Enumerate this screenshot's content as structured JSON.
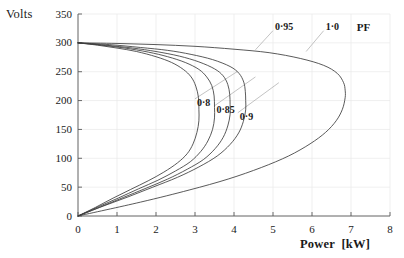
{
  "chart_data": {
    "type": "line",
    "title": "",
    "xlabel": "Power  [kW]",
    "ylabel": "Volts",
    "xlim": [
      0,
      8
    ],
    "ylim": [
      0,
      350
    ],
    "xticks": [
      "0",
      "1",
      "2",
      "3",
      "4",
      "5",
      "6",
      "7",
      "8"
    ],
    "yticks": [
      "0",
      "50",
      "100",
      "150",
      "200",
      "250",
      "300",
      "350"
    ],
    "grid": true,
    "legend_position": "inline-annotations",
    "legend_title": "PF",
    "series": [
      {
        "name": "0·8",
        "label": "0·8",
        "nose_point": {
          "x": 3.1,
          "y": 165
        },
        "upper_branch": [
          {
            "x": 0.0,
            "y": 300
          },
          {
            "x": 0.5,
            "y": 296
          },
          {
            "x": 1.0,
            "y": 291
          },
          {
            "x": 1.5,
            "y": 285
          },
          {
            "x": 2.0,
            "y": 276
          },
          {
            "x": 2.4,
            "y": 266
          },
          {
            "x": 2.7,
            "y": 254
          },
          {
            "x": 2.9,
            "y": 241
          },
          {
            "x": 3.02,
            "y": 225
          },
          {
            "x": 3.09,
            "y": 205
          },
          {
            "x": 3.1,
            "y": 185
          },
          {
            "x": 3.1,
            "y": 165
          }
        ],
        "lower_branch": [
          {
            "x": 3.1,
            "y": 165
          },
          {
            "x": 3.05,
            "y": 145
          },
          {
            "x": 2.95,
            "y": 125
          },
          {
            "x": 2.8,
            "y": 108
          },
          {
            "x": 2.55,
            "y": 92
          },
          {
            "x": 2.2,
            "y": 76
          },
          {
            "x": 1.8,
            "y": 61
          },
          {
            "x": 1.35,
            "y": 46
          },
          {
            "x": 0.9,
            "y": 31
          },
          {
            "x": 0.45,
            "y": 15
          },
          {
            "x": 0.0,
            "y": 0
          }
        ]
      },
      {
        "name": "0·85",
        "label": "0·85",
        "nose_point": {
          "x": 3.5,
          "y": 170
        },
        "upper_branch": [
          {
            "x": 0.0,
            "y": 300
          },
          {
            "x": 0.6,
            "y": 296
          },
          {
            "x": 1.2,
            "y": 291
          },
          {
            "x": 1.8,
            "y": 284
          },
          {
            "x": 2.3,
            "y": 276
          },
          {
            "x": 2.75,
            "y": 266
          },
          {
            "x": 3.1,
            "y": 254
          },
          {
            "x": 3.3,
            "y": 241
          },
          {
            "x": 3.43,
            "y": 226
          },
          {
            "x": 3.49,
            "y": 208
          },
          {
            "x": 3.5,
            "y": 188
          },
          {
            "x": 3.5,
            "y": 170
          }
        ],
        "lower_branch": [
          {
            "x": 3.5,
            "y": 170
          },
          {
            "x": 3.45,
            "y": 150
          },
          {
            "x": 3.33,
            "y": 130
          },
          {
            "x": 3.15,
            "y": 112
          },
          {
            "x": 2.88,
            "y": 94
          },
          {
            "x": 2.5,
            "y": 78
          },
          {
            "x": 2.05,
            "y": 62
          },
          {
            "x": 1.55,
            "y": 47
          },
          {
            "x": 1.03,
            "y": 31
          },
          {
            "x": 0.52,
            "y": 16
          },
          {
            "x": 0.0,
            "y": 0
          }
        ]
      },
      {
        "name": "0·9",
        "label": "0·9",
        "nose_point": {
          "x": 3.9,
          "y": 176
        },
        "upper_branch": [
          {
            "x": 0.0,
            "y": 300
          },
          {
            "x": 0.7,
            "y": 296
          },
          {
            "x": 1.4,
            "y": 291
          },
          {
            "x": 2.0,
            "y": 285
          },
          {
            "x": 2.6,
            "y": 277
          },
          {
            "x": 3.1,
            "y": 267
          },
          {
            "x": 3.5,
            "y": 255
          },
          {
            "x": 3.72,
            "y": 243
          },
          {
            "x": 3.84,
            "y": 228
          },
          {
            "x": 3.89,
            "y": 211
          },
          {
            "x": 3.9,
            "y": 193
          },
          {
            "x": 3.9,
            "y": 176
          }
        ],
        "lower_branch": [
          {
            "x": 3.9,
            "y": 176
          },
          {
            "x": 3.84,
            "y": 156
          },
          {
            "x": 3.72,
            "y": 136
          },
          {
            "x": 3.52,
            "y": 117
          },
          {
            "x": 3.22,
            "y": 98
          },
          {
            "x": 2.8,
            "y": 81
          },
          {
            "x": 2.3,
            "y": 64
          },
          {
            "x": 1.74,
            "y": 48
          },
          {
            "x": 1.16,
            "y": 32
          },
          {
            "x": 0.58,
            "y": 16
          },
          {
            "x": 0.0,
            "y": 0
          }
        ]
      },
      {
        "name": "0·95",
        "label": "0·95",
        "nose_point": {
          "x": 4.3,
          "y": 184
        },
        "upper_branch": [
          {
            "x": 0.0,
            "y": 300
          },
          {
            "x": 0.8,
            "y": 297
          },
          {
            "x": 1.6,
            "y": 292
          },
          {
            "x": 2.3,
            "y": 287
          },
          {
            "x": 2.9,
            "y": 280
          },
          {
            "x": 3.45,
            "y": 271
          },
          {
            "x": 3.9,
            "y": 259
          },
          {
            "x": 4.13,
            "y": 247
          },
          {
            "x": 4.25,
            "y": 232
          },
          {
            "x": 4.29,
            "y": 216
          },
          {
            "x": 4.3,
            "y": 200
          },
          {
            "x": 4.3,
            "y": 184
          }
        ],
        "lower_branch": [
          {
            "x": 4.3,
            "y": 184
          },
          {
            "x": 4.24,
            "y": 164
          },
          {
            "x": 4.12,
            "y": 144
          },
          {
            "x": 3.9,
            "y": 124
          },
          {
            "x": 3.57,
            "y": 104
          },
          {
            "x": 3.1,
            "y": 85
          },
          {
            "x": 2.55,
            "y": 67
          },
          {
            "x": 1.92,
            "y": 50
          },
          {
            "x": 1.28,
            "y": 33
          },
          {
            "x": 0.64,
            "y": 17
          },
          {
            "x": 0.0,
            "y": 0
          }
        ]
      },
      {
        "name": "1·0",
        "label": "1·0",
        "nose_point": {
          "x": 6.85,
          "y": 205
        },
        "upper_branch": [
          {
            "x": 0.0,
            "y": 300
          },
          {
            "x": 1.0,
            "y": 299
          },
          {
            "x": 2.0,
            "y": 297
          },
          {
            "x": 3.0,
            "y": 294
          },
          {
            "x": 4.0,
            "y": 289
          },
          {
            "x": 4.9,
            "y": 283
          },
          {
            "x": 5.7,
            "y": 273
          },
          {
            "x": 6.3,
            "y": 261
          },
          {
            "x": 6.65,
            "y": 247
          },
          {
            "x": 6.81,
            "y": 231
          },
          {
            "x": 6.85,
            "y": 218
          },
          {
            "x": 6.85,
            "y": 205
          }
        ],
        "lower_branch": [
          {
            "x": 6.85,
            "y": 205
          },
          {
            "x": 6.78,
            "y": 185
          },
          {
            "x": 6.62,
            "y": 165
          },
          {
            "x": 6.35,
            "y": 145
          },
          {
            "x": 5.95,
            "y": 125
          },
          {
            "x": 5.4,
            "y": 104
          },
          {
            "x": 4.7,
            "y": 84
          },
          {
            "x": 3.85,
            "y": 64
          },
          {
            "x": 2.85,
            "y": 45
          },
          {
            "x": 1.6,
            "y": 24
          },
          {
            "x": 0.0,
            "y": 0
          }
        ]
      }
    ],
    "annotations": [
      {
        "label": "0·8",
        "text_x": 3.05,
        "text_y": 196,
        "leader_to_x": 4.1,
        "leader_to_y": 251
      },
      {
        "label": "0·85",
        "text_x": 3.55,
        "text_y": 184,
        "leader_to_x": 4.55,
        "leader_to_y": 241
      },
      {
        "label": "0·9",
        "text_x": 4.15,
        "text_y": 172,
        "leader_to_x": 5.15,
        "leader_to_y": 231
      },
      {
        "label": "0·95",
        "text_x": 5.05,
        "text_y": 328,
        "leader_to_x": 4.55,
        "leader_to_y": 288
      },
      {
        "label": "1·0",
        "text_x": 6.35,
        "text_y": 328,
        "leader_to_x": 5.85,
        "leader_to_y": 285
      },
      {
        "label": "PF",
        "text_x": 7.15,
        "text_y": 328,
        "leader_to_x": null,
        "leader_to_y": null
      }
    ]
  },
  "axes": {
    "ylabel_title": "Volts",
    "xlabel_title": "Power  [kW]",
    "ytick_labels": [
      "350",
      "300",
      "250",
      "200",
      "150",
      "100",
      "50",
      "0"
    ],
    "xtick_labels": [
      "0",
      "1",
      "2",
      "3",
      "4",
      "5",
      "6",
      "7",
      "8"
    ]
  },
  "style": {
    "curve_color": "#3c3c3c",
    "axis_color": "#5a5a5a",
    "grid_color": "#e8e8e8",
    "leader_color": "#9a9a9a",
    "text_color": "#1a1a1a",
    "background": "#ffffff"
  }
}
